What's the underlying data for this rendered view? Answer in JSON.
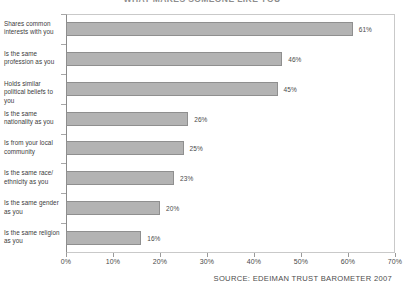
{
  "chart_data": {
    "type": "bar",
    "orientation": "horizontal",
    "title": "WHAT MAKES SOMEONE LIKE YOU",
    "categories": [
      "Shares common interests with you",
      "Is the same profession as you",
      "Holds similar political beliefs to you",
      "Is the same nationality as you",
      "Is from your local community",
      "Is the same race/ ethnicity as you",
      "Is the same gender as you",
      "Is the same religion as you"
    ],
    "values": [
      61,
      46,
      45,
      26,
      25,
      23,
      20,
      16
    ],
    "value_labels": [
      "61%",
      "46%",
      "45%",
      "26%",
      "25%",
      "23%",
      "20%",
      "16%"
    ],
    "xlabel": "",
    "ylabel": "",
    "xlim": [
      0,
      70
    ],
    "xticks": [
      0,
      10,
      20,
      30,
      40,
      50,
      60,
      70
    ],
    "xtick_labels": [
      "0%",
      "10%",
      "20%",
      "30%",
      "40%",
      "50%",
      "60%",
      "70%"
    ],
    "grid": false,
    "legend": false,
    "bar_color": "#b3b3b3",
    "bar_border_color": "#8f8f8f"
  },
  "footer": {
    "source": "SOURCE: EDEIMAN TRUST BAROMETER 2007"
  }
}
